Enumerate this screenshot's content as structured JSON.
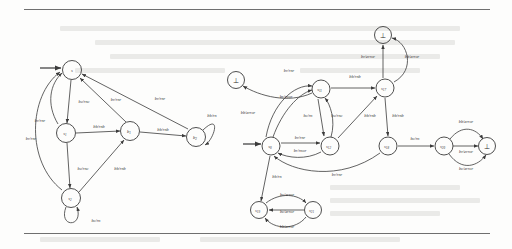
{
  "figure": {
    "type": "state-machine-diagram",
    "caption": "",
    "ink_color": "#3b3b3b",
    "page_background": "#fdfdfc",
    "rule_color": "#6f6f6f",
    "bottom_symbol": "⊥"
  },
  "left_machine": {
    "name": "left-automaton",
    "states": [
      {
        "id": "s0",
        "label": "s",
        "sub": "",
        "cx": 72,
        "cy": 70,
        "r": 9.5,
        "initial": true
      },
      {
        "id": "s1",
        "label": "s",
        "sub": "1",
        "cx": 66,
        "cy": 133,
        "r": 9.5,
        "initial": false
      },
      {
        "id": "b1",
        "label": "b",
        "sub": "1",
        "cx": 130,
        "cy": 131,
        "r": 9.5,
        "initial": false
      },
      {
        "id": "b2",
        "label": "b",
        "sub": "2",
        "cx": 196,
        "cy": 137,
        "r": 9.5,
        "initial": false
      },
      {
        "id": "s2",
        "label": "s",
        "sub": "2",
        "cx": 71,
        "cy": 198,
        "r": 9.5,
        "initial": false
      }
    ],
    "transitions": [
      {
        "from": "s0",
        "to": "s1",
        "label": "bc/rnc"
      },
      {
        "from": "s1",
        "to": "b1",
        "label": "bb/rnb"
      },
      {
        "from": "b1",
        "to": "b2",
        "label": "bb/rnb"
      },
      {
        "from": "b1",
        "to": "s0",
        "label": "br/rnr"
      },
      {
        "from": "b2",
        "to": "s0",
        "label": "br/rnr"
      },
      {
        "from": "s1",
        "to": "s0",
        "label": "br/rnr"
      },
      {
        "from": "s2",
        "to": "s0",
        "label": "br/rnr"
      },
      {
        "from": "s1",
        "to": "s2",
        "label": "bc/rnc"
      },
      {
        "from": "s2",
        "to": "b1",
        "label": "bb/rnb"
      },
      {
        "from": "s2",
        "to": "s2",
        "label": "bc/rn",
        "self": true
      },
      {
        "from": "b2",
        "to": "b2",
        "label": "bb/rn",
        "self": true
      }
    ]
  },
  "right_machine": {
    "name": "right-automaton",
    "states": [
      {
        "id": "r_bot_left",
        "label": "⊥",
        "sub": "",
        "cx": 236,
        "cy": 80,
        "r": 8.5,
        "bottom": true
      },
      {
        "id": "r_bot_top",
        "label": "⊥",
        "sub": "",
        "cx": 383,
        "cy": 35,
        "r": 8.5,
        "bottom": true
      },
      {
        "id": "r_bot_right",
        "label": "⊥",
        "sub": "",
        "cx": 487,
        "cy": 146,
        "r": 8.5,
        "bottom": true
      },
      {
        "id": "s0r",
        "label": "s",
        "sub": "0",
        "cx": 271,
        "cy": 146,
        "r": 9.0,
        "initial": true
      },
      {
        "id": "s11",
        "label": "s",
        "sub": "11",
        "cx": 321,
        "cy": 89,
        "r": 9.0
      },
      {
        "id": "s12",
        "label": "s",
        "sub": "12",
        "cx": 330,
        "cy": 146,
        "r": 9.0
      },
      {
        "id": "s17",
        "label": "s",
        "sub": "17",
        "cx": 385,
        "cy": 88,
        "r": 9.0
      },
      {
        "id": "s18",
        "label": "s",
        "sub": "18",
        "cx": 388,
        "cy": 146,
        "r": 9.0
      },
      {
        "id": "s20",
        "label": "s",
        "sub": "20",
        "cx": 444,
        "cy": 146,
        "r": 9.0
      },
      {
        "id": "s19",
        "label": "s",
        "sub": "19",
        "cx": 259,
        "cy": 210,
        "r": 8.5
      },
      {
        "id": "s21",
        "label": "s",
        "sub": "21",
        "cx": 313,
        "cy": 210,
        "r": 8.5
      }
    ],
    "transitions": [
      {
        "from": "s0r",
        "to": "s11",
        "label": "br/rnr"
      },
      {
        "from": "s0r",
        "to": "s11",
        "label": "br/rnor"
      },
      {
        "from": "s11",
        "to": "s17",
        "label": "bb/rnb"
      },
      {
        "from": "s0r",
        "to": "s12",
        "label": "br/rnr"
      },
      {
        "from": "s12",
        "to": "s0r",
        "label": "br/rnor"
      },
      {
        "from": "s12",
        "to": "s11",
        "label": "bc/rnc"
      },
      {
        "from": "s11",
        "to": "s12",
        "label": "bc/rn"
      },
      {
        "from": "s12",
        "to": "s17",
        "label": "bb/rnb"
      },
      {
        "from": "s11",
        "to": "r_bot_left",
        "label": "bb/error"
      },
      {
        "from": "s17",
        "to": "r_bot_top",
        "label": "br/error"
      },
      {
        "from": "s17",
        "to": "r_bot_top",
        "label": "bb/error"
      },
      {
        "from": "s17",
        "to": "s18",
        "label": "bb/rnb"
      },
      {
        "from": "s18",
        "to": "s0r",
        "label": "br/rnr"
      },
      {
        "from": "s18",
        "to": "s20",
        "label": "bc/rn"
      },
      {
        "from": "s20",
        "to": "r_bot_right",
        "label": "bb/error"
      },
      {
        "from": "s20",
        "to": "r_bot_right",
        "label": "br/error"
      },
      {
        "from": "s20",
        "to": "r_bot_right",
        "label": "bc/error"
      },
      {
        "from": "s0r",
        "to": "s19",
        "label": "bb/rn"
      },
      {
        "from": "s19",
        "to": "s21",
        "label": "bc/error"
      },
      {
        "from": "s21",
        "to": "s19",
        "label": "bc/error"
      },
      {
        "from": "s21",
        "to": "s19",
        "label": "bb/error"
      }
    ]
  },
  "edge_labels_left": [
    {
      "id": "L1",
      "text": "bc/rnc",
      "x": 84,
      "y": 103
    },
    {
      "id": "L2",
      "text": "br/rnr",
      "x": 116,
      "y": 101
    },
    {
      "id": "L3",
      "text": "br/rnr",
      "x": 160,
      "y": 100
    },
    {
      "id": "L4",
      "text": "br/rnr",
      "x": 40,
      "y": 122
    },
    {
      "id": "L5",
      "text": "br/rnr",
      "x": 31,
      "y": 140
    },
    {
      "id": "L6",
      "text": "bb/rnb",
      "x": 99,
      "y": 128
    },
    {
      "id": "L7",
      "text": "bb/rnb",
      "x": 163,
      "y": 131
    },
    {
      "id": "L8",
      "text": "bb/rn",
      "x": 212,
      "y": 117
    },
    {
      "id": "L9",
      "text": "bc/rnc",
      "x": 83,
      "y": 170
    },
    {
      "id": "L10",
      "text": "bb/rnb",
      "x": 120,
      "y": 170
    },
    {
      "id": "L11",
      "text": "bc/rn",
      "x": 96,
      "y": 222
    }
  ],
  "edge_labels_right": [
    {
      "id": "R1",
      "text": "br/rnr",
      "x": 289,
      "y": 72
    },
    {
      "id": "R2",
      "text": "br/rnor",
      "x": 286,
      "y": 98
    },
    {
      "id": "R3",
      "text": "bb/rnb",
      "x": 355,
      "y": 78
    },
    {
      "id": "R4",
      "text": "bc/rn",
      "x": 308,
      "y": 117
    },
    {
      "id": "R5",
      "text": "bc/rnc",
      "x": 337,
      "y": 117
    },
    {
      "id": "R6",
      "text": "bb/rnb",
      "x": 370,
      "y": 117
    },
    {
      "id": "R7",
      "text": "bb/error",
      "x": 248,
      "y": 114
    },
    {
      "id": "R8",
      "text": "br/error",
      "x": 368,
      "y": 58
    },
    {
      "id": "R9",
      "text": "bb/error",
      "x": 412,
      "y": 58
    },
    {
      "id": "R10",
      "text": "br/rnr",
      "x": 300,
      "y": 139
    },
    {
      "id": "R11",
      "text": "br/rnor",
      "x": 300,
      "y": 152
    },
    {
      "id": "R12",
      "text": "br/rnr",
      "x": 337,
      "y": 176
    },
    {
      "id": "R13",
      "text": "bb/rnb",
      "x": 398,
      "y": 117
    },
    {
      "id": "R14",
      "text": "bc/rn",
      "x": 415,
      "y": 140
    },
    {
      "id": "R15",
      "text": "bb/error",
      "x": 466,
      "y": 123
    },
    {
      "id": "R16",
      "text": "br/error",
      "x": 466,
      "y": 153
    },
    {
      "id": "R17",
      "text": "bc/error",
      "x": 466,
      "y": 170
    },
    {
      "id": "R18",
      "text": "bb/rn",
      "x": 277,
      "y": 178
    },
    {
      "id": "R19",
      "text": "bc/error",
      "x": 287,
      "y": 196
    },
    {
      "id": "R20",
      "text": "bc/error",
      "x": 287,
      "y": 213
    },
    {
      "id": "R21",
      "text": "bb/error",
      "x": 287,
      "y": 228
    }
  ],
  "ghost_text_rows": [
    {
      "x": 60,
      "y": 26,
      "w": 400
    },
    {
      "x": 95,
      "y": 40,
      "w": 360
    },
    {
      "x": 110,
      "y": 54,
      "w": 330
    },
    {
      "x": 75,
      "y": 68,
      "w": 150
    },
    {
      "x": 300,
      "y": 68,
      "w": 120
    },
    {
      "x": 330,
      "y": 185,
      "w": 130
    },
    {
      "x": 330,
      "y": 198,
      "w": 150
    },
    {
      "x": 330,
      "y": 211,
      "w": 110
    },
    {
      "x": 40,
      "y": 237,
      "w": 120
    },
    {
      "x": 200,
      "y": 237,
      "w": 200
    }
  ]
}
